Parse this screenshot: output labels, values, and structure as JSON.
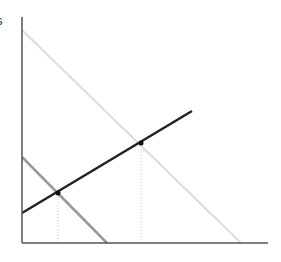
{
  "diagram": {
    "y_axis_label": "s",
    "x_axis_label": "",
    "axes": {
      "origin": [
        22,
        243
      ],
      "y_top": [
        22,
        17
      ],
      "x_end": [
        268,
        243
      ],
      "color": "#555555"
    },
    "lines": [
      {
        "name": "light-gray-line",
        "from": [
          22,
          30
        ],
        "to": [
          241,
          243
        ],
        "color": "#dddddd",
        "width": 2
      },
      {
        "name": "medium-gray-line",
        "from": [
          22,
          157
        ],
        "to": [
          107,
          243
        ],
        "color": "#999999",
        "width": 2.5
      },
      {
        "name": "black-line",
        "from": [
          22,
          213
        ],
        "to": [
          192,
          111
        ],
        "color": "#222222",
        "width": 2.5
      }
    ],
    "intersections": [
      {
        "name": "intersection-low",
        "point": [
          58,
          193
        ]
      },
      {
        "name": "intersection-high",
        "point": [
          141,
          143
        ]
      }
    ],
    "guide_color": "#cccccc"
  }
}
